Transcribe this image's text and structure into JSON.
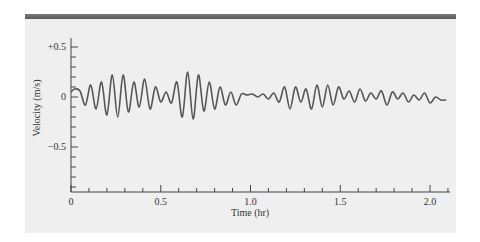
{
  "chart_data": {
    "type": "line",
    "title": "",
    "xlabel": "Time (hr)",
    "ylabel": "Velocity (m/s)",
    "xlim": [
      0,
      2.1
    ],
    "ylim": [
      -0.95,
      0.6
    ],
    "x_ticks": [
      "0",
      "0.5",
      "1.0",
      "1.5",
      "2.0"
    ],
    "y_ticks": [
      "+0.5",
      "0",
      "−0.5"
    ],
    "grid": false,
    "legend": null,
    "series": [
      {
        "name": "velocity",
        "color": "#555555",
        "x": [
          0.0,
          0.02,
          0.05,
          0.08,
          0.11,
          0.14,
          0.17,
          0.2,
          0.23,
          0.26,
          0.29,
          0.32,
          0.35,
          0.38,
          0.41,
          0.44,
          0.47,
          0.5,
          0.53,
          0.56,
          0.59,
          0.62,
          0.65,
          0.68,
          0.71,
          0.74,
          0.77,
          0.8,
          0.83,
          0.86,
          0.89,
          0.92,
          0.95,
          0.98,
          1.01,
          1.04,
          1.07,
          1.1,
          1.13,
          1.16,
          1.19,
          1.22,
          1.25,
          1.28,
          1.31,
          1.34,
          1.37,
          1.4,
          1.43,
          1.46,
          1.49,
          1.52,
          1.55,
          1.58,
          1.61,
          1.64,
          1.67,
          1.7,
          1.73,
          1.76,
          1.79,
          1.82,
          1.85,
          1.88,
          1.91,
          1.94,
          1.97,
          2.0,
          2.03,
          2.06,
          2.09
        ],
        "y": [
          0.05,
          0.08,
          0.06,
          -0.08,
          0.12,
          -0.12,
          0.15,
          -0.18,
          0.22,
          -0.2,
          0.22,
          -0.15,
          0.15,
          -0.1,
          0.18,
          -0.12,
          0.1,
          -0.05,
          0.05,
          -0.06,
          0.15,
          -0.2,
          0.25,
          -0.22,
          0.22,
          -0.14,
          0.15,
          -0.12,
          0.1,
          -0.08,
          0.05,
          -0.08,
          0.03,
          0.02,
          0.03,
          0.0,
          0.03,
          -0.02,
          0.04,
          -0.05,
          0.1,
          -0.12,
          0.1,
          -0.05,
          0.08,
          -0.12,
          0.12,
          -0.1,
          0.12,
          -0.08,
          0.1,
          -0.02,
          0.06,
          -0.05,
          0.08,
          -0.04,
          0.04,
          -0.02,
          0.06,
          -0.08,
          0.05,
          -0.02,
          0.04,
          -0.05,
          0.02,
          -0.03,
          0.04,
          -0.06,
          0.0,
          -0.03,
          -0.03
        ]
      }
    ]
  },
  "header_bar_color": "#666666",
  "panel_color": "#efefef"
}
